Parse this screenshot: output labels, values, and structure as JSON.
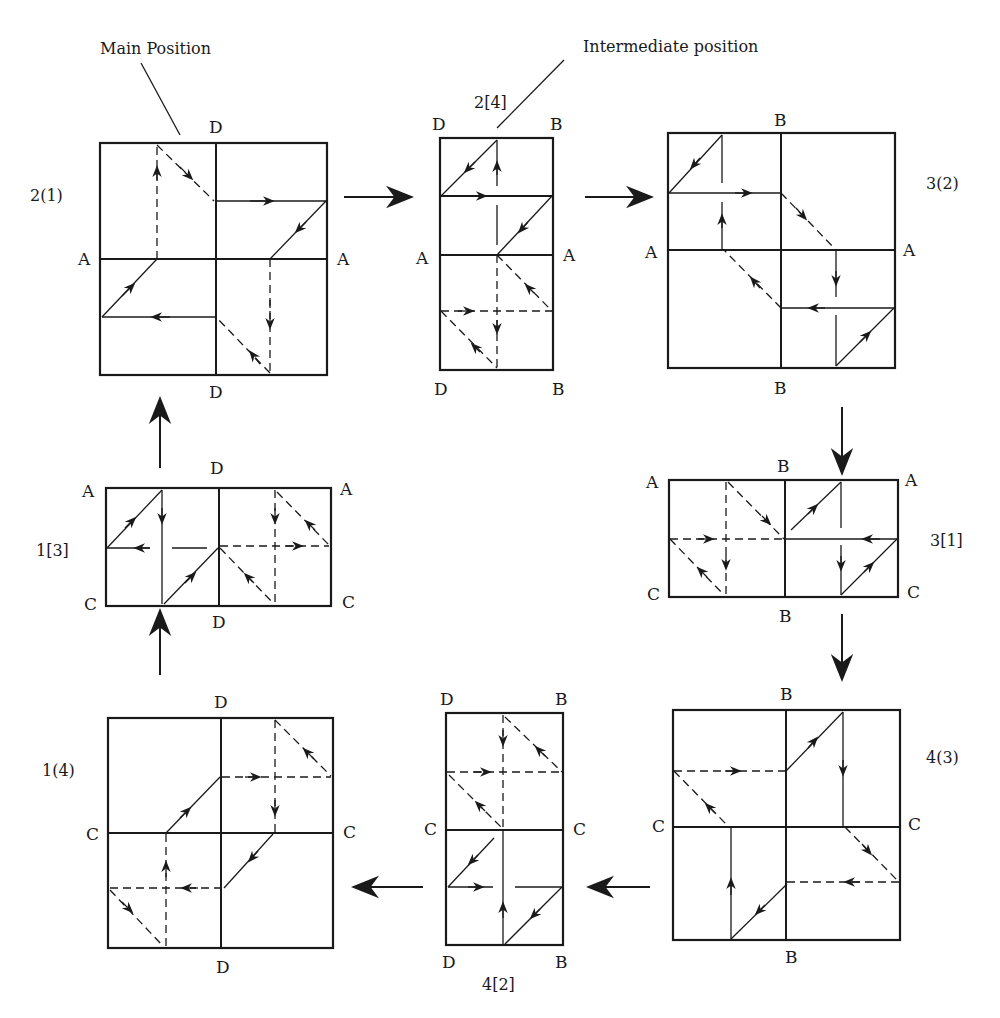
{
  "annotations": {
    "main_position": "Main Position",
    "intermediate_position": "Intermediate position"
  },
  "panels": [
    {
      "id": "2(1)",
      "type": "main",
      "labels": {
        "top": "D",
        "bottom": "D",
        "left": "A",
        "right": "A"
      }
    },
    {
      "id": "2[4]",
      "type": "intermediate",
      "labels": {
        "top_left": "D",
        "top_right": "B",
        "left": "A",
        "right": "A",
        "bottom_left": "D",
        "bottom_right": "B"
      }
    },
    {
      "id": "3(2)",
      "type": "main",
      "labels": {
        "top": "B",
        "bottom": "B",
        "left": "A",
        "right": "A"
      }
    },
    {
      "id": "3[1]",
      "type": "intermediate",
      "labels": {
        "top": "B",
        "bottom": "B",
        "top_left": "A",
        "top_right": "A",
        "bottom_left": "C",
        "bottom_right": "C"
      }
    },
    {
      "id": "4(3)",
      "type": "main",
      "labels": {
        "top": "B",
        "bottom": "B",
        "left": "C",
        "right": "C"
      }
    },
    {
      "id": "4[2]",
      "type": "intermediate",
      "labels": {
        "top_left": "D",
        "top_right": "B",
        "left": "C",
        "right": "C",
        "bottom_left": "D",
        "bottom_right": "B"
      }
    },
    {
      "id": "1(4)",
      "type": "main",
      "labels": {
        "top": "D",
        "bottom": "D",
        "left": "C",
        "right": "C"
      }
    },
    {
      "id": "1[3]",
      "type": "intermediate",
      "labels": {
        "top": "D",
        "bottom": "D",
        "top_left": "A",
        "top_right": "A",
        "bottom_left": "C",
        "bottom_right": "C"
      }
    }
  ],
  "sequence": [
    "2(1)",
    "2[4]",
    "3(2)",
    "3[1]",
    "4(3)",
    "4[2]",
    "1(4)",
    "1[3]",
    "2(1)"
  ],
  "legend": {
    "solid_line": "visible path",
    "dashed_line": "hidden path"
  }
}
